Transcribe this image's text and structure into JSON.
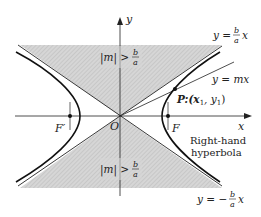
{
  "figure": {
    "axes": {
      "x_label": "x",
      "y_label": "y",
      "origin_label": "O"
    },
    "foci": {
      "left": "F′",
      "right": "F"
    },
    "point": {
      "label": "P:(x",
      "sub1": "1",
      "mid": ", y",
      "sub2": "1",
      "close": ")"
    },
    "lines": {
      "upper_asymptote": {
        "lhs": "y =",
        "num": "b",
        "den": "a",
        "rhs": "x"
      },
      "lower_asymptote": {
        "lhs": "y = −",
        "num": "b",
        "den": "a",
        "rhs": "x"
      },
      "secant": "y = mx"
    },
    "region_labels": {
      "upper": {
        "lhs": "|m| >",
        "num": "b",
        "den": "a"
      },
      "lower": {
        "lhs": "|m| >",
        "num": "b",
        "den": "a"
      }
    },
    "caption": {
      "line1": "Right-hand",
      "line2": "hyperbola"
    },
    "colors": {
      "shade": "#c8c8c8",
      "ink": "#222222",
      "background": "#ffffff"
    }
  }
}
